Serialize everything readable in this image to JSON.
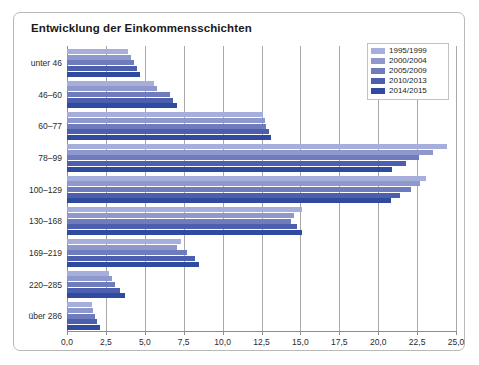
{
  "chart_title": "Entwicklung der Einkommensschichten",
  "legend": {
    "position": "top-right",
    "items": [
      {
        "label": "1995/1999",
        "color": "#a6aedb"
      },
      {
        "label": "2000/2004",
        "color": "#8e98cd"
      },
      {
        "label": "2005/2009",
        "color": "#6e7cbe"
      },
      {
        "label": "2010/2013",
        "color": "#4c5faf"
      },
      {
        "label": "2014/2015",
        "color": "#2f4a9e"
      }
    ]
  },
  "xaxis": {
    "ticks": [
      "0,0",
      "2,5",
      "5,0",
      "7,5",
      "10,0",
      "12,5",
      "15,0",
      "17,5",
      "20,0",
      "22,5",
      "25,0"
    ],
    "tickvalues": [
      0,
      2.5,
      5,
      7.5,
      10,
      12.5,
      15,
      17.5,
      20,
      22.5,
      25
    ],
    "min": 0,
    "max": 25
  },
  "chart_data": {
    "type": "bar",
    "orientation": "horizontal",
    "title": "Entwicklung der Einkommensschichten",
    "xlabel": "",
    "ylabel": "",
    "xlim": [
      0,
      25
    ],
    "grid": true,
    "legend_position": "top-right",
    "categories": [
      "unter 46",
      "46–60",
      "60–77",
      "78–99",
      "100–129",
      "130–168",
      "169–219",
      "220–285",
      "über 286"
    ],
    "series": [
      {
        "name": "1995/1999",
        "color": "#a6aedb",
        "values": [
          3.9,
          5.6,
          12.6,
          24.4,
          23.1,
          15.1,
          7.3,
          2.7,
          1.6
        ]
      },
      {
        "name": "2000/2004",
        "color": "#8e98cd",
        "values": [
          4.1,
          5.8,
          12.7,
          23.5,
          22.7,
          14.6,
          7.1,
          2.9,
          1.7
        ]
      },
      {
        "name": "2005/2009",
        "color": "#6e7cbe",
        "values": [
          4.3,
          6.6,
          12.8,
          22.6,
          22.1,
          14.4,
          7.7,
          3.1,
          1.8
        ]
      },
      {
        "name": "2010/2013",
        "color": "#4c5faf",
        "values": [
          4.5,
          6.8,
          13.0,
          21.8,
          21.4,
          14.8,
          8.2,
          3.4,
          1.9
        ]
      },
      {
        "name": "2014/2015",
        "color": "#2f4a9e",
        "values": [
          4.7,
          7.1,
          13.1,
          20.9,
          20.8,
          15.1,
          8.5,
          3.7,
          2.1
        ]
      }
    ]
  }
}
